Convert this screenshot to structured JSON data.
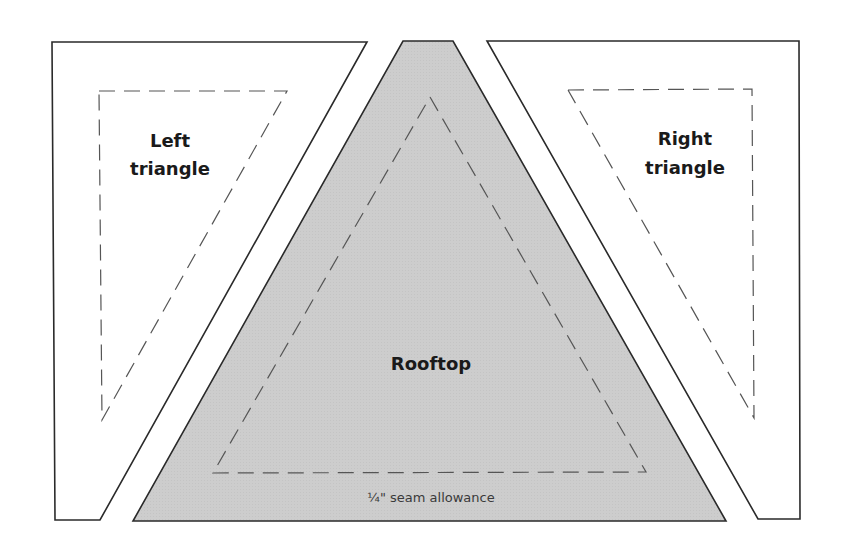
{
  "diagram": {
    "pieces": [
      {
        "id": "left",
        "label_line1": "Left",
        "label_line2": "triangle",
        "fill": "#ffffff"
      },
      {
        "id": "rooftop",
        "label": "Rooftop",
        "fill": "#cfcfcf"
      },
      {
        "id": "right",
        "label_line1": "Right",
        "label_line2": "triangle",
        "fill": "#ffffff"
      }
    ],
    "seam_note": "¼\" seam allowance",
    "colors": {
      "outline": "#2a2a2a",
      "dash": "#555555",
      "rooftop_fill": "#cfcfcf"
    }
  }
}
